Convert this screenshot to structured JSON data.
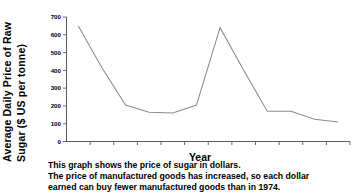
{
  "chart_data": {
    "type": "line",
    "title": "",
    "xlabel": "Year",
    "ylabel_line1": "Average Daily Price of Raw",
    "ylabel_line2": "Sugar ($ US per tonne)",
    "ylabel": "Average Daily Price of Raw Sugar ($ US per tonne)",
    "x": [
      "74",
      "75",
      "76",
      "77",
      "78",
      "79",
      "80",
      "81",
      "82",
      "83",
      "84",
      "85"
    ],
    "values": [
      650,
      415,
      205,
      165,
      160,
      205,
      640,
      400,
      170,
      170,
      125,
      110
    ],
    "xtick_labels": [
      "74",
      "75",
      "76",
      "77",
      "78",
      "79",
      "80",
      "81",
      "82",
      "83",
      "84",
      "85"
    ],
    "ytick_labels": [
      "0",
      "100",
      "200",
      "300",
      "400",
      "500",
      "600",
      "700"
    ],
    "ytick_values": [
      0,
      100,
      200,
      300,
      400,
      500,
      600,
      700
    ],
    "ylim": [
      0,
      700
    ],
    "xlim": [
      "74",
      "85"
    ],
    "grid": false,
    "legend": false,
    "series": [
      {
        "name": "Average Daily Price of Raw Sugar",
        "values": [
          650,
          415,
          205,
          165,
          160,
          205,
          640,
          400,
          170,
          170,
          125,
          110
        ]
      }
    ],
    "line_color": "#8a8a8a",
    "axis_color": "#5a5a5a",
    "background_color": "#ffffff"
  },
  "caption": {
    "line1": "This graph shows the price of sugar in dollars.",
    "line2": "The price of manufactured goods has increased, so each dollar",
    "line3": "earned can buy fewer manufactured goods than in 1974."
  }
}
